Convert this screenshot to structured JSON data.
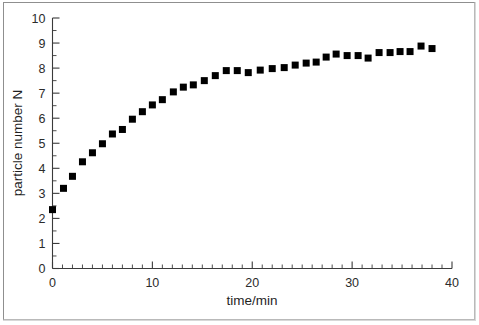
{
  "chart_data": {
    "type": "scatter",
    "title": "",
    "xlabel": "time/min",
    "ylabel": "particle number N",
    "xlim": [
      0,
      40
    ],
    "ylim": [
      0,
      10
    ],
    "grid": false,
    "legend": null,
    "x_ticks_major": [
      0,
      10,
      20,
      30,
      40
    ],
    "x_tick_labels": [
      "0",
      "10",
      "20",
      "30",
      "40"
    ],
    "x_minor_interval": 1,
    "y_ticks_major": [
      0,
      1,
      2,
      3,
      4,
      5,
      6,
      7,
      8,
      9,
      10
    ],
    "y_tick_labels": [
      "0",
      "1",
      "2",
      "3",
      "4",
      "5",
      "6",
      "7",
      "8",
      "9",
      "10"
    ],
    "y_minor_interval": 0.5,
    "marker": {
      "shape": "square",
      "color": "#000000",
      "size_px": 7
    },
    "series": [
      {
        "name": "particle number N",
        "points": [
          [
            0.0,
            2.35
          ],
          [
            1.1,
            3.2
          ],
          [
            2.0,
            3.68
          ],
          [
            3.0,
            4.26
          ],
          [
            4.0,
            4.62
          ],
          [
            5.0,
            4.98
          ],
          [
            6.0,
            5.37
          ],
          [
            7.0,
            5.55
          ],
          [
            8.0,
            5.96
          ],
          [
            9.0,
            6.26
          ],
          [
            10.0,
            6.53
          ],
          [
            11.0,
            6.74
          ],
          [
            12.1,
            7.05
          ],
          [
            13.1,
            7.24
          ],
          [
            14.1,
            7.33
          ],
          [
            15.2,
            7.5
          ],
          [
            16.3,
            7.7
          ],
          [
            17.4,
            7.9
          ],
          [
            18.5,
            7.9
          ],
          [
            19.6,
            7.82
          ],
          [
            20.8,
            7.92
          ],
          [
            22.0,
            7.98
          ],
          [
            23.2,
            8.02
          ],
          [
            24.3,
            8.12
          ],
          [
            25.4,
            8.2
          ],
          [
            26.4,
            8.24
          ],
          [
            27.4,
            8.44
          ],
          [
            28.4,
            8.56
          ],
          [
            29.5,
            8.5
          ],
          [
            30.6,
            8.5
          ],
          [
            31.6,
            8.4
          ],
          [
            32.7,
            8.62
          ],
          [
            33.8,
            8.62
          ],
          [
            34.8,
            8.66
          ],
          [
            35.8,
            8.66
          ],
          [
            36.9,
            8.88
          ],
          [
            38.0,
            8.78
          ]
        ]
      }
    ]
  }
}
